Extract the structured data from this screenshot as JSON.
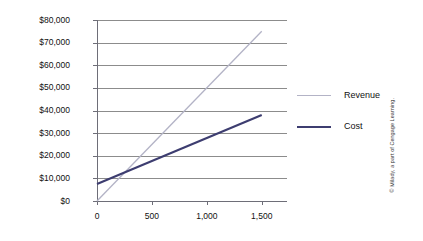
{
  "chart_data": {
    "type": "line",
    "title": "",
    "subtitle": "",
    "xlabel": "",
    "ylabel": "",
    "x": [
      0,
      1500
    ],
    "xlim": [
      0,
      1730
    ],
    "ylim": [
      0,
      80000
    ],
    "grid": true,
    "legend_position": "right",
    "x_tick_labels": [
      "0",
      "500",
      "1,000",
      "1,500"
    ],
    "x_tick_values": [
      0,
      500,
      1000,
      1500
    ],
    "y_tick_labels": [
      "$0",
      "$10,000",
      "$20,000",
      "$30,000",
      "$40,000",
      "$50,000",
      "$60,000",
      "$70,000",
      "$80,000"
    ],
    "y_tick_values": [
      0,
      10000,
      20000,
      30000,
      40000,
      50000,
      60000,
      70000,
      80000
    ],
    "series": [
      {
        "name": "Revenue",
        "color": "#b3b3c6",
        "width": 1.3,
        "values": [
          0,
          75000
        ]
      },
      {
        "name": "Cost",
        "color": "#3d3d70",
        "width": 2.1,
        "values": [
          7500,
          38000
        ]
      }
    ],
    "annotations": []
  },
  "legend": {
    "items": [
      {
        "label": "Revenue",
        "color": "#b3b3c6",
        "width": 1.3
      },
      {
        "label": "Cost",
        "color": "#3d3d70",
        "width": 2.1
      }
    ]
  },
  "credit": {
    "text": "© Milady, a part of Cengage Learning."
  },
  "colors": {
    "grid": "#8c8c8c",
    "axis": "#6e6e78",
    "background": "#ffffff",
    "text": "#111111"
  }
}
